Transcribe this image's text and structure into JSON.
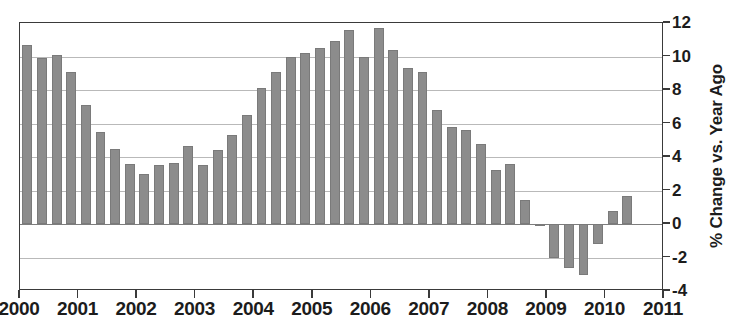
{
  "chart_data": {
    "type": "bar",
    "title": "",
    "subtitle": "",
    "xlabel": "",
    "ylabel": "% Change vs. Year Ago",
    "ylim": [
      -4,
      12
    ],
    "ytick_step": 2,
    "yticks": [
      12,
      10,
      8,
      6,
      4,
      2,
      0,
      -2,
      -4
    ],
    "ytick_labels": [
      "12",
      "10",
      "8",
      "6",
      "4",
      "2",
      "0",
      "-2",
      "-4"
    ],
    "xlim": [
      2000,
      2011
    ],
    "xticks": [
      2000,
      2001,
      2002,
      2003,
      2004,
      2005,
      2006,
      2007,
      2008,
      2009,
      2010,
      2011
    ],
    "xtick_labels": [
      "2000",
      "2001",
      "2002",
      "2003",
      "2004",
      "2005",
      "2006",
      "2007",
      "2008",
      "2009",
      "2010",
      "2011"
    ],
    "frequency": "quarterly",
    "grid": true,
    "grid_axis": "y",
    "legend": "none",
    "bar_color": "#8c8c8c",
    "axis_color": "#3a3a3a",
    "grid_color": "#b9b9b9",
    "categories": [
      "2000 Q1",
      "2000 Q2",
      "2000 Q3",
      "2000 Q4",
      "2001 Q1",
      "2001 Q2",
      "2001 Q3",
      "2001 Q4",
      "2002 Q1",
      "2002 Q2",
      "2002 Q3",
      "2002 Q4",
      "2003 Q1",
      "2003 Q2",
      "2003 Q3",
      "2003 Q4",
      "2004 Q1",
      "2004 Q2",
      "2004 Q3",
      "2004 Q4",
      "2005 Q1",
      "2005 Q2",
      "2005 Q3",
      "2005 Q4",
      "2006 Q1",
      "2006 Q2",
      "2006 Q3",
      "2006 Q4",
      "2007 Q1",
      "2007 Q2",
      "2007 Q3",
      "2007 Q4",
      "2008 Q1",
      "2008 Q2",
      "2008 Q3",
      "2008 Q4",
      "2009 Q1",
      "2009 Q2",
      "2009 Q3",
      "2009 Q4",
      "2010 Q1",
      "2010 Q2"
    ],
    "values": [
      10.7,
      9.9,
      10.1,
      9.1,
      7.1,
      5.5,
      4.5,
      3.6,
      3.0,
      3.5,
      3.65,
      4.65,
      3.5,
      4.4,
      5.3,
      6.5,
      8.1,
      9.1,
      10.0,
      10.2,
      10.5,
      10.9,
      11.6,
      10.0,
      11.7,
      10.4,
      9.3,
      9.1,
      6.8,
      5.8,
      5.6,
      4.8,
      3.2,
      3.6,
      1.45,
      -0.05,
      -2.0,
      -2.6,
      -3.05,
      -1.2,
      0.8,
      1.65
    ]
  }
}
